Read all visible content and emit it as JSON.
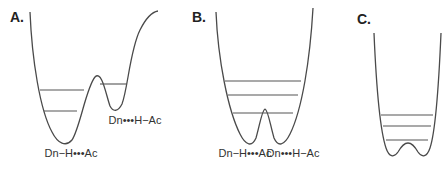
{
  "panels": [
    {
      "id": "A",
      "label": "A.",
      "description": "Asymmetric double-well potential with barrier",
      "states": [
        "Dn−H•••Ac",
        "Dn•••H−Ac"
      ],
      "energy_levels_left_well": 2,
      "energy_levels_right_well": 1
    },
    {
      "id": "B",
      "label": "B.",
      "description": "Symmetric double-well potential with low barrier",
      "states": [
        "Dn−H•••Ac",
        "Dn•••H−Ac"
      ],
      "energy_levels": 3
    },
    {
      "id": "C",
      "label": "C.",
      "description": "Single broad well with very low central barrier",
      "states": [],
      "energy_levels": 3
    }
  ],
  "colors": {
    "curve": "#4a4a4a",
    "level": "#555555",
    "text": "#333333"
  }
}
